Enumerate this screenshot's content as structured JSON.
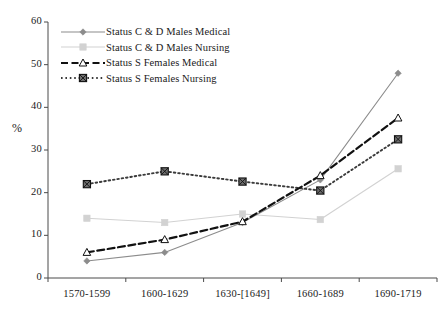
{
  "chart_data": {
    "type": "line",
    "title": "",
    "xlabel": "",
    "ylabel": "%",
    "ylim": [
      0,
      60
    ],
    "ytick_step": 10,
    "yticks": [
      "0",
      "10",
      "20",
      "30",
      "40",
      "50",
      "60"
    ],
    "grid": false,
    "legend_position": "top-left-inside",
    "categories": [
      "1570-1599",
      "1600-1629",
      "1630-[1649]",
      "1660-1689",
      "1690-1719"
    ],
    "series": [
      {
        "name": "Status C & D Males Medical",
        "values": [
          4,
          6,
          13,
          23,
          48
        ],
        "color": "#8c8c8c",
        "line_style": "solid",
        "marker": "diamond"
      },
      {
        "name": "Status C & D Males Nursing",
        "values": [
          14,
          13,
          15,
          13.7,
          25.6
        ],
        "color": "#d2d2d2",
        "line_style": "solid",
        "marker": "square"
      },
      {
        "name": "Status S Females Medical",
        "values": [
          6,
          9,
          13.2,
          24,
          37.5
        ],
        "color": "#111111",
        "line_style": "dashed",
        "marker": "triangle-open"
      },
      {
        "name": "Status S Females Nursing",
        "values": [
          22,
          25,
          22.6,
          20.5,
          32.5
        ],
        "color": "#3a3a3a",
        "line_style": "dotted",
        "marker": "square-hatched"
      }
    ]
  },
  "axis": {
    "y_title": "%"
  }
}
